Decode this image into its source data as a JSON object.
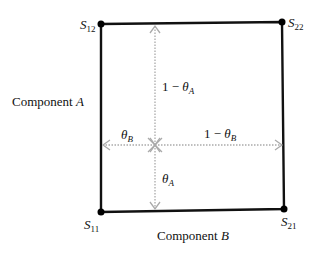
{
  "diagram": {
    "corners": {
      "s12": {
        "base": "S",
        "sub": "12"
      },
      "s22": {
        "base": "S",
        "sub": "22"
      },
      "s11": {
        "base": "S",
        "sub": "11"
      },
      "s21": {
        "base": "S",
        "sub": "21"
      }
    },
    "axis_labels": {
      "component_a": {
        "text": "Component ",
        "var": "A"
      },
      "component_b": {
        "text": "Component ",
        "var": "B"
      }
    },
    "distances": {
      "up": {
        "prefix": "1 − ",
        "sym": "θ",
        "sub": "A"
      },
      "down": {
        "sym": "θ",
        "sub": "A"
      },
      "left": {
        "sym": "θ",
        "sub": "B"
      },
      "right": {
        "prefix": "1 − ",
        "sym": "θ",
        "sub": "B"
      }
    },
    "colors": {
      "frame": "#111111",
      "arrows": "#b0b0b0"
    }
  }
}
